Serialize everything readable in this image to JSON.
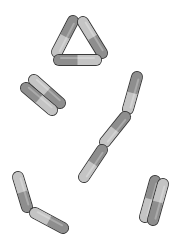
{
  "image": {
    "width": 183,
    "height": 244,
    "background": "#ffffff",
    "description": "Rod-shaped capsule cells (bacilli) in grayscale, two-tone halves with dark outlines",
    "outline_color": "#3a3a3a",
    "rod_width": 10,
    "colors": {
      "dark": "#8e8e8e",
      "light": "#c4c4c4"
    }
  },
  "groups": [
    {
      "name": "triangle-cluster",
      "rods": [
        {
          "x1": 73,
          "y1": 21,
          "x2": 57,
          "y2": 52,
          "first": "dark",
          "second": "light"
        },
        {
          "x1": 83,
          "y1": 22,
          "x2": 102,
          "y2": 53,
          "first": "light",
          "second": "dark"
        },
        {
          "x1": 59,
          "y1": 60,
          "x2": 96,
          "y2": 60,
          "first": "dark",
          "second": "light"
        }
      ]
    },
    {
      "name": "parallel-pair-upper-left",
      "rods": [
        {
          "x1": 34,
          "y1": 80,
          "x2": 60,
          "y2": 103,
          "first": "light",
          "second": "dark"
        },
        {
          "x1": 26,
          "y1": 88,
          "x2": 52,
          "y2": 110,
          "first": "dark",
          "second": "light"
        }
      ]
    },
    {
      "name": "chain-right",
      "rods": [
        {
          "x1": 137,
          "y1": 77,
          "x2": 128,
          "y2": 109,
          "first": "dark",
          "second": "light"
        },
        {
          "x1": 125,
          "y1": 117,
          "x2": 105,
          "y2": 142,
          "first": "dark",
          "second": "light"
        },
        {
          "x1": 102,
          "y1": 150,
          "x2": 84,
          "y2": 177,
          "first": "dark",
          "second": "light"
        }
      ]
    },
    {
      "name": "bent-pair-lower-left",
      "rods": [
        {
          "x1": 18,
          "y1": 177,
          "x2": 27,
          "y2": 207,
          "first": "light",
          "second": "dark"
        },
        {
          "x1": 35,
          "y1": 213,
          "x2": 63,
          "y2": 228,
          "first": "light",
          "second": "dark"
        }
      ]
    },
    {
      "name": "parallel-pair-lower-right",
      "rods": [
        {
          "x1": 155,
          "y1": 181,
          "x2": 145,
          "y2": 217,
          "first": "dark",
          "second": "light"
        },
        {
          "x1": 163,
          "y1": 184,
          "x2": 153,
          "y2": 220,
          "first": "light",
          "second": "dark"
        }
      ]
    }
  ]
}
